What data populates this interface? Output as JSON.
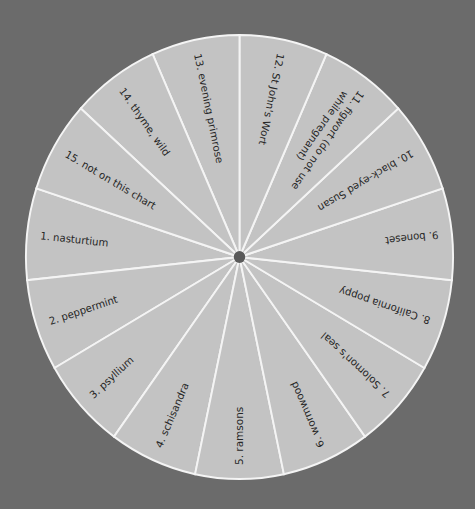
{
  "diagram": {
    "type": "wheel",
    "colors": {
      "background": "#6b6b6b",
      "segment_fill": "#c3c3c3",
      "divider": "#f4f4f4",
      "text": "#262626",
      "hub": "#5a5a5a"
    },
    "segments": [
      {
        "number": "1.",
        "label": "nasturtium"
      },
      {
        "number": "2.",
        "label": "peppermint"
      },
      {
        "number": "3.",
        "label": "psyllium"
      },
      {
        "number": "4.",
        "label": "schisandra"
      },
      {
        "number": "5.",
        "label": "ramsons"
      },
      {
        "number": "6.",
        "label": "wormwood"
      },
      {
        "number": "7.",
        "label": "Solomon's seal"
      },
      {
        "number": "8.",
        "label": "California poppy"
      },
      {
        "number": "9.",
        "label": "boneset"
      },
      {
        "number": "10.",
        "label": "black-eyed Susan"
      },
      {
        "number": "11.",
        "label": "figwort (do not use",
        "label2": "while pregnant)"
      },
      {
        "number": "12.",
        "label": "St John's Wort"
      },
      {
        "number": "13.",
        "label": "evening primrose"
      },
      {
        "number": "14.",
        "label": "thyme, wild"
      },
      {
        "number": "15.",
        "label": "not on this chart"
      }
    ]
  }
}
